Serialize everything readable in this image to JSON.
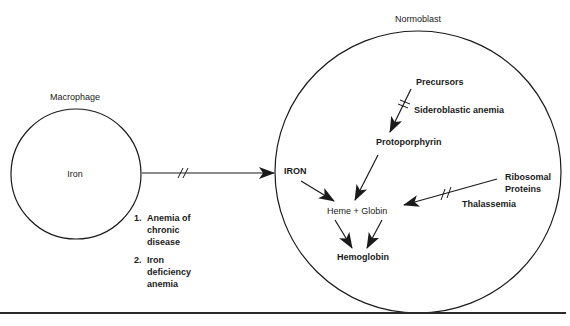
{
  "title_left": "Macrophage",
  "title_right": "Normoblast",
  "macrophage": {
    "content": "Iron"
  },
  "normoblast": {
    "iron": "IRON",
    "precursors": "Precursors",
    "sideroblastic": "Sideroblastic anemia",
    "protoporphyrin": "Protoporphyrin",
    "heme_globin": "Heme + Globin",
    "hemoglobin": "Hemoglobin",
    "ribosomal_1": "Ribosomal",
    "ribosomal_2": "Proteins",
    "thalassemia": "Thalassemia"
  },
  "defects": {
    "item1_num": "1.",
    "item1_line1": "Anemia of",
    "item1_line2": "chronic",
    "item1_line3": "disease",
    "item2_num": "2.",
    "item2_line1": "Iron",
    "item2_line2": "deficiency",
    "item2_line3": "anemia"
  },
  "colors": {
    "stroke": "#1a1a1a",
    "background": "#ffffff"
  }
}
